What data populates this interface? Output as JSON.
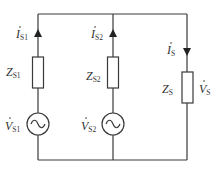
{
  "diagram": {
    "type": "circuit",
    "colors": {
      "wire": "#3a3a3a",
      "text": "#333333",
      "background": "#ffffff"
    },
    "branches": [
      {
        "id": "s1",
        "current": {
          "symbol": "I",
          "subscript": "S1",
          "direction": "up"
        },
        "impedance": {
          "symbol": "Z",
          "subscript": "S1"
        },
        "source": {
          "symbol": "V",
          "subscript": "S1",
          "type": "ac-voltage-source"
        }
      },
      {
        "id": "s2",
        "current": {
          "symbol": "I",
          "subscript": "S2",
          "direction": "up"
        },
        "impedance": {
          "symbol": "Z",
          "subscript": "S2"
        },
        "source": {
          "symbol": "V",
          "subscript": "S2",
          "type": "ac-voltage-source"
        }
      },
      {
        "id": "s",
        "current": {
          "symbol": "I",
          "subscript": "S",
          "direction": "down"
        },
        "impedance": {
          "symbol": "Z",
          "subscript": "S"
        },
        "voltage": {
          "symbol": "V",
          "subscript": "S"
        }
      }
    ]
  }
}
